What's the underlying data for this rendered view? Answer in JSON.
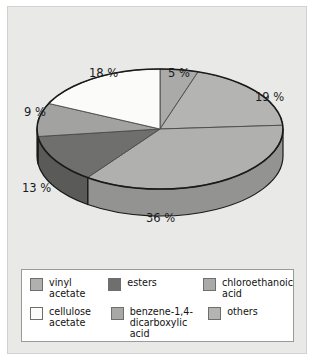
{
  "chart_data": {
    "type": "pie",
    "title": "",
    "three_d": true,
    "start_angle_deg": -90,
    "direction": "clockwise",
    "categories": [
      "vinyl acetate",
      "chloroethanoic acid",
      "others",
      "esters",
      "benzene-1,4-dicarboxylic acid",
      "cellulose acetate"
    ],
    "values": [
      5,
      19,
      36,
      13,
      9,
      18
    ],
    "labels": [
      "5 %",
      "19 %",
      "36 %",
      "13 %",
      "9 %",
      "18 %"
    ],
    "colors": [
      "#aaaaa8",
      "#b4b4b2",
      "#b0b0ae",
      "#6f6f6d",
      "#a2a2a0",
      "#fbfbf9"
    ],
    "legend_position": "bottom",
    "grid": false
  },
  "figure": {
    "background": "#e9e9e7",
    "border_color": "#d2d2d0",
    "outer_background": "#ffffff"
  },
  "pie": {
    "slices": [
      {
        "name": "vinyl acetate",
        "pct_label": "5 %",
        "value": 5,
        "color": "#aaaaa8",
        "side_color": "#8e8e8c"
      },
      {
        "name": "chloroethanoic acid",
        "pct_label": "19 %",
        "value": 19,
        "color": "#b4b4b2",
        "side_color": "#979795"
      },
      {
        "name": "others",
        "pct_label": "36 %",
        "value": 36,
        "color": "#b0b0ae",
        "side_color": "#939391"
      },
      {
        "name": "esters",
        "pct_label": "13 %",
        "value": 13,
        "color": "#6f6f6d",
        "side_color": "#5a5a58"
      },
      {
        "name": "benzene-1,4-dicarboxylic acid",
        "pct_label": "9 %",
        "value": 9,
        "color": "#a2a2a0",
        "side_color": "#888886"
      },
      {
        "name": "cellulose acetate",
        "pct_label": "18 %",
        "value": 18,
        "color": "#fbfbf9",
        "side_color": "#d6d6d4"
      }
    ],
    "outline_color": "#1a1a1a"
  },
  "labels": {
    "p5": "5 %",
    "p19": "19 %",
    "p36": "36 %",
    "p13": "13 %",
    "p9": "9 %",
    "p18": "18 %"
  },
  "legend": {
    "row1": [
      {
        "label": "vinyl\nacetate",
        "color": "#b0b0ae"
      },
      {
        "label": "esters",
        "color": "#6f6f6d"
      },
      {
        "label": "chloroethanoic\nacid",
        "color": "#aaaaa8"
      }
    ],
    "row2": [
      {
        "label": "cellulose\nacetate",
        "color": "#fcfcfa"
      },
      {
        "label": "benzene-1,4-\ndicarboxylic acid",
        "color": "#a8a8a6"
      },
      {
        "label": "others",
        "color": "#b4b4b2"
      }
    ]
  }
}
